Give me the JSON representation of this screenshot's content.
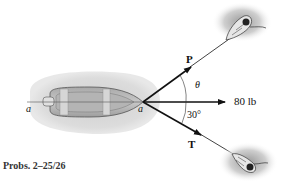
{
  "figure": {
    "caption": "Probs. 2–25/26",
    "labels": {
      "force_p": "P",
      "force_t": "T",
      "resultant": "80 lb",
      "angle_theta": "θ",
      "angle_30": "30°",
      "axis_a_left": "a",
      "axis_a_right": "a"
    },
    "colors": {
      "water": "#d9d9d9",
      "hull": "#bdbdbd",
      "hull_dark": "#8c8c8c",
      "arrows": "#111111",
      "rope": "#444444"
    }
  }
}
